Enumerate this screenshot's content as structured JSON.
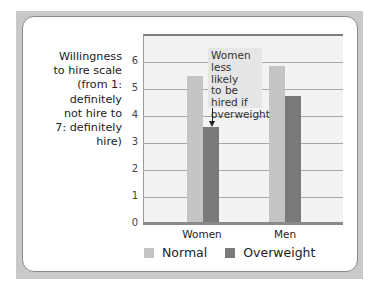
{
  "chart_data": {
    "type": "bar",
    "title": "",
    "ylabel": "Willingness to hire scale (from 1: definitely not hire to 7: definitely hire)",
    "xlabel": "",
    "categories": [
      "Women",
      "Men"
    ],
    "series": [
      {
        "name": "Normal",
        "color": "#c4c4c4",
        "values": [
          5.5,
          5.85
        ]
      },
      {
        "name": "Overweight",
        "color": "#7a7a7a",
        "values": [
          3.6,
          4.75
        ]
      }
    ],
    "ylim": [
      0,
      7
    ],
    "yticks": [
      0,
      1,
      2,
      3,
      4,
      5,
      6
    ],
    "grid": true,
    "legend_position": "bottom",
    "annotations": [
      {
        "text": "Women less likely to be hired if overweight",
        "target": "Women / Overweight"
      }
    ]
  },
  "ylabel_lines": [
    "Willingness",
    "to hire scale",
    "(from 1: definitely",
    "not hire to",
    "7: definitely hire)"
  ],
  "yticks": [
    "0",
    "1",
    "2",
    "3",
    "4",
    "5",
    "6"
  ],
  "categories": [
    "Women",
    "Men"
  ],
  "annotation_lines": [
    "Women",
    "less likely",
    "to be",
    "hired if",
    "overweight"
  ],
  "legend": [
    {
      "label": "Normal",
      "color": "#c4c4c4"
    },
    {
      "label": "Overweight",
      "color": "#7a7a7a"
    }
  ]
}
